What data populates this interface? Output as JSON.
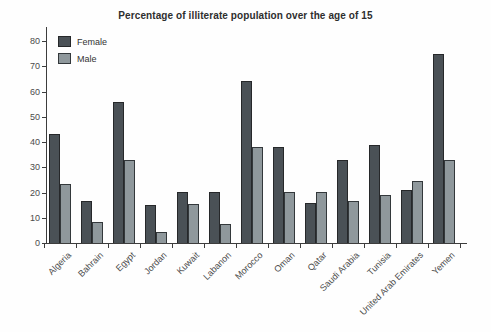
{
  "chart_data": {
    "type": "bar",
    "title": "Percentage of illiterate population over the age of 15",
    "categories": [
      "Algeria",
      "Bahrain",
      "Egypt",
      "Jordan",
      "Kuwait",
      "Labanon",
      "Morocco",
      "Oman",
      "Qatar",
      "Saudi Arabia",
      "Tunisia",
      "United Arab Emirates",
      "Yemen"
    ],
    "series": [
      {
        "name": "Female",
        "color": "#4a5156",
        "border": "#26282a",
        "values": [
          43,
          16.5,
          56,
          15,
          20,
          20,
          64,
          38,
          16,
          33,
          39,
          21,
          75
        ]
      },
      {
        "name": "Male",
        "color": "#8f989c",
        "border": "#33383b",
        "values": [
          23.5,
          8.5,
          33,
          4.5,
          15.5,
          7.5,
          38,
          20,
          20,
          16.5,
          19,
          24.5,
          33
        ]
      }
    ],
    "ylim": [
      0,
      80
    ],
    "ytick_step": 10,
    "yticks": [
      0,
      10,
      20,
      30,
      40,
      50,
      60,
      70,
      80
    ],
    "xlabel": "",
    "ylabel": "",
    "legend_position": "top-left",
    "grid": false
  }
}
